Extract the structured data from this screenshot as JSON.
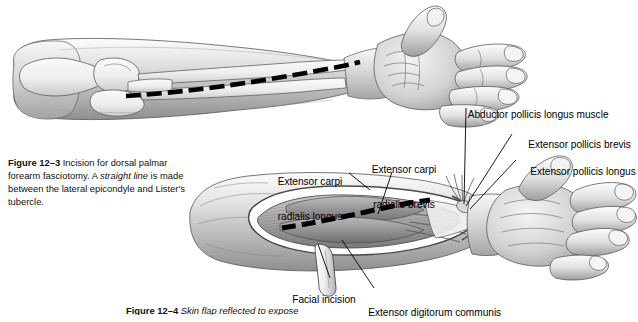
{
  "page": {
    "background": "#ffffff",
    "ink": "#000000"
  },
  "figure_top": {
    "name": "dorsal-forearm-skeletal-overlay",
    "description": "Grayscale pencil illustration of a right forearm and dorsal hand with radius and ulna visible beneath the skin, a dashed black incision line running from the lateral epicondyle to Lister's tubercle.",
    "caption": {
      "figure_number": "Figure 12–3",
      "text_before_italic": "Incision for dorsal palmar forearm fasciotomy. A ",
      "italic_text": "straight line",
      "text_after_italic": " is made between the lateral epicondyle and Lister's tubercle."
    }
  },
  "figure_bottom": {
    "name": "skin-flap-reflected-dissection",
    "description": "Grayscale pencil illustration of a dissected dorsal forearm with the skin flap reflected to expose the extensor muscle compartment, a dashed incision across the muscle bellies, and a fascial flap hanging inferiorly.",
    "caption": {
      "figure_number": "Figure 12–4",
      "text_before_italic": "Skin flap reflected to expose",
      "italic_text": "",
      "text_after_italic": ""
    },
    "labels": [
      {
        "id": "extensor-carpi-radialis-longus",
        "line1": "Extensor carpi",
        "line2": "radialis longus"
      },
      {
        "id": "extensor-carpi-radialis-brevis",
        "line1": "Extensor carpi",
        "line2": "radialis brevis"
      },
      {
        "id": "abductor-pollicis-longus-muscle",
        "line1": "Abductor pollicis longus muscle",
        "line2": ""
      },
      {
        "id": "extensor-pollicis-brevis",
        "line1": "Extensor pollicis brevis",
        "line2": ""
      },
      {
        "id": "extensor-pollicis-longus",
        "line1": "Extensor pollicis longus",
        "line2": ""
      },
      {
        "id": "facial-incision",
        "line1": "Facial incision",
        "line2": ""
      },
      {
        "id": "extensor-digitorum-communis",
        "line1": "Extensor digitorum communis",
        "line2": ""
      }
    ]
  }
}
